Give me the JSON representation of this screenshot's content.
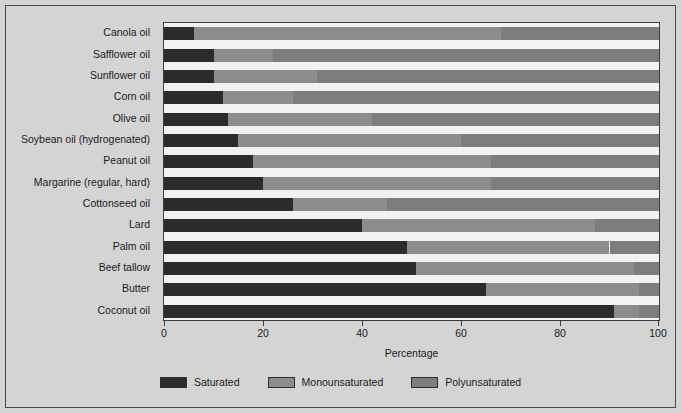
{
  "chart_data": {
    "type": "bar",
    "orientation": "horizontal",
    "stacked": true,
    "title": "",
    "xlabel": "Percentage",
    "ylabel": "",
    "xlim": [
      0,
      100
    ],
    "xticks": [
      0,
      20,
      40,
      60,
      80,
      100
    ],
    "grid": false,
    "legend_position": "bottom",
    "categories": [
      "Canola oil",
      "Safflower oil",
      "Sunflower oil",
      "Corn oil",
      "Olive oil",
      "Soybean oil (hydrogenated)",
      "Peanut oil",
      "Margarine (regular, hard)",
      "Cottonseed oil",
      "Lard",
      "Palm oil",
      "Beef tallow",
      "Butter",
      "Coconut oil"
    ],
    "series": [
      {
        "name": "Saturated",
        "color": "#2b2b2b",
        "values": [
          6,
          10,
          10,
          12,
          13,
          15,
          18,
          20,
          26,
          40,
          49,
          51,
          65,
          91
        ]
      },
      {
        "name": "Monounsaturated",
        "color": "#8c8c8c",
        "values": [
          62,
          12,
          21,
          14,
          29,
          45,
          48,
          46,
          19,
          47,
          41,
          44,
          31,
          5
        ]
      },
      {
        "name": "Polyunsaturated",
        "color": "#7d7d7d",
        "values": [
          32,
          78,
          69,
          74,
          58,
          40,
          34,
          34,
          55,
          13,
          10,
          5,
          4,
          4
        ]
      }
    ]
  },
  "axis": {
    "tick_labels": [
      "0",
      "20",
      "40",
      "60",
      "80",
      "100"
    ],
    "x_title": "Percentage"
  },
  "legend": {
    "items": [
      {
        "label": "Saturated",
        "color": "#2b2b2b"
      },
      {
        "label": "Monounsaturated",
        "color": "#8c8c8c"
      },
      {
        "label": "Polyunsaturated",
        "color": "#7d7d7d"
      }
    ]
  },
  "colors": {
    "background": "#d4d4d4",
    "plot_background": "#f2f2f2",
    "frame": "#4a4a4a",
    "axis": "#3c3c3c",
    "text": "#1a1a1a"
  }
}
